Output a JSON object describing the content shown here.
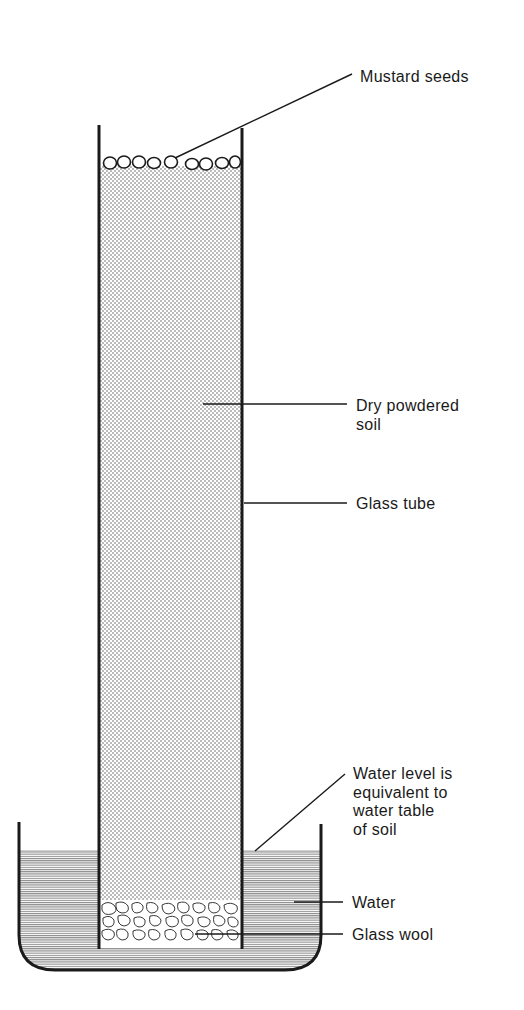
{
  "diagram": {
    "labels": {
      "mustard_seeds": "Mustard seeds",
      "dry_soil": "Dry powdered\nsoil",
      "glass_tube": "Glass tube",
      "water_level": "Water level is\nequivalent to\nwater table\nof soil",
      "water": "Water",
      "glass_wool": "Glass wool"
    },
    "components": [
      "mustard-seeds",
      "glass-tube",
      "dry-powdered-soil",
      "glass-wool",
      "water",
      "beaker"
    ],
    "colors": {
      "ink": "#1a1a1a",
      "soil_dots": "#555555",
      "water_lines": "#777777",
      "background": "#ffffff"
    }
  }
}
